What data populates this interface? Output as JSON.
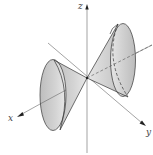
{
  "diagram": {
    "axes": {
      "z_label": "z",
      "x_label": "x",
      "y_label": "y"
    },
    "colors": {
      "cone_fill": "#c8c8c8",
      "cone_fill_light": "#e6e6e6",
      "outline": "#333333",
      "axis": "#555555"
    }
  }
}
